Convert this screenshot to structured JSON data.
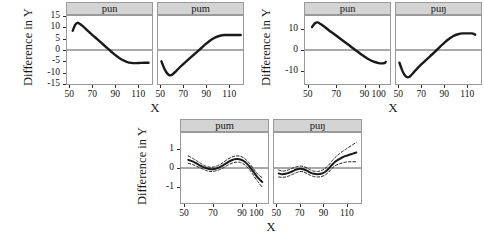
{
  "figure": {
    "groups": [
      {
        "name": "top-left",
        "ylabel": "Difference in Y",
        "xlabel": "X",
        "ylim": [
          -15,
          15
        ],
        "yticks": [
          "15",
          "10",
          "5",
          "0",
          "-5",
          "-10",
          "-15"
        ],
        "ytick_values": [
          15,
          10,
          5,
          0,
          -5,
          -10,
          -15
        ],
        "panels": [
          {
            "label": "pun",
            "xlim": [
              48,
              122
            ],
            "xticks": [
              "50",
              "70",
              "90",
              "110"
            ],
            "xtick_values": [
              50,
              70,
              90,
              110
            ],
            "series": [
              {
                "name": "fitted",
                "style": "solid",
                "x": [
                  53,
                  55,
                  57,
                  59,
                  62,
                  65,
                  68,
                  72,
                  76,
                  80,
                  84,
                  88,
                  92,
                  96,
                  100,
                  104,
                  108,
                  112,
                  116,
                  119
                ],
                "y": [
                  8.5,
                  11.0,
                  12.0,
                  11.6,
                  10.4,
                  9.0,
                  7.6,
                  5.8,
                  4.0,
                  2.2,
                  0.4,
                  -1.4,
                  -3.0,
                  -4.3,
                  -5.2,
                  -5.7,
                  -5.8,
                  -5.7,
                  -5.6,
                  -5.6
                ]
              }
            ]
          },
          {
            "label": "pum",
            "xlim": [
              48,
              122
            ],
            "xticks": [
              "50",
              "70",
              "90",
              "110"
            ],
            "xtick_values": [
              50,
              70,
              90,
              110
            ],
            "series": [
              {
                "name": "fitted",
                "style": "solid",
                "x": [
                  51,
                  53,
                  55,
                  57,
                  59,
                  61,
                  64,
                  67,
                  70,
                  74,
                  78,
                  82,
                  86,
                  90,
                  94,
                  98,
                  102,
                  106,
                  110,
                  114,
                  118,
                  120
                ],
                "y": [
                  -5.0,
                  -7.6,
                  -9.6,
                  -10.8,
                  -11.2,
                  -10.6,
                  -9.2,
                  -7.6,
                  -6.2,
                  -4.4,
                  -2.6,
                  -0.8,
                  1.0,
                  2.8,
                  4.4,
                  5.6,
                  6.3,
                  6.6,
                  6.6,
                  6.6,
                  6.6,
                  6.6
                ]
              }
            ]
          }
        ]
      },
      {
        "name": "top-right",
        "ylabel": "Difference in Y",
        "xlabel": "X",
        "ylim": [
          -16,
          16
        ],
        "yticks": [
          "10",
          "0",
          "-10"
        ],
        "ytick_values": [
          10,
          0,
          -10
        ],
        "panels": [
          {
            "label": "pun",
            "xlim": [
              48,
              108
            ],
            "xticks": [
              "50",
              "70",
              "90",
              "100"
            ],
            "xtick_values": [
              50,
              70,
              90,
              100
            ],
            "series": [
              {
                "name": "fitted",
                "style": "solid",
                "x": [
                  53,
                  55,
                  57,
                  59,
                  62,
                  65,
                  68,
                  72,
                  76,
                  80,
                  84,
                  88,
                  92,
                  96,
                  100,
                  102,
                  104,
                  105
                ],
                "y": [
                  10.8,
                  12.6,
                  13.0,
                  12.2,
                  10.8,
                  9.2,
                  7.8,
                  5.8,
                  3.8,
                  1.8,
                  -0.2,
                  -2.2,
                  -4.0,
                  -5.4,
                  -6.2,
                  -6.3,
                  -6.2,
                  -5.6
                ]
              }
            ]
          },
          {
            "label": "puŋ",
            "xlim": [
              48,
              122
            ],
            "xticks": [
              "50",
              "70",
              "90",
              "110"
            ],
            "xtick_values": [
              50,
              70,
              90,
              110
            ],
            "series": [
              {
                "name": "fitted",
                "style": "solid",
                "x": [
                  51,
                  53,
                  55,
                  57,
                  59,
                  61,
                  64,
                  67,
                  70,
                  74,
                  78,
                  82,
                  86,
                  90,
                  94,
                  98,
                  102,
                  106,
                  110,
                  114,
                  117
                ],
                "y": [
                  -6.0,
                  -9.0,
                  -11.4,
                  -12.6,
                  -12.8,
                  -12.0,
                  -10.2,
                  -8.4,
                  -6.8,
                  -4.8,
                  -2.8,
                  -0.8,
                  1.4,
                  3.4,
                  5.2,
                  6.6,
                  7.4,
                  7.8,
                  7.8,
                  7.8,
                  7.2
                ]
              }
            ]
          }
        ]
      },
      {
        "name": "bottom",
        "ylabel": "Difference in Y",
        "xlabel": "X",
        "ylim": [
          -1.8,
          1.8
        ],
        "yticks": [
          "1",
          "0",
          "-1"
        ],
        "ytick_values": [
          1,
          0,
          -1
        ],
        "panels": [
          {
            "label": "pum",
            "xlim": [
              48,
              108
            ],
            "xticks": [
              "50",
              "70",
              "90",
              "100"
            ],
            "xtick_values": [
              50,
              70,
              90,
              100
            ],
            "series": [
              {
                "name": "fitted",
                "style": "solid",
                "x": [
                  53,
                  56,
                  59,
                  62,
                  65,
                  68,
                  71,
                  74,
                  77,
                  80,
                  83,
                  86,
                  89,
                  92,
                  95,
                  98,
                  101,
                  104
                ],
                "y": [
                  0.42,
                  0.34,
                  0.22,
                  0.1,
                  0.0,
                  -0.06,
                  -0.05,
                  0.02,
                  0.14,
                  0.28,
                  0.4,
                  0.46,
                  0.44,
                  0.32,
                  0.1,
                  -0.2,
                  -0.5,
                  -0.72
                ]
              },
              {
                "name": "upper-ci",
                "style": "dashed",
                "x": [
                  53,
                  56,
                  59,
                  62,
                  65,
                  68,
                  71,
                  74,
                  77,
                  80,
                  83,
                  86,
                  89,
                  92,
                  95,
                  98,
                  101,
                  104
                ],
                "y": [
                  0.62,
                  0.5,
                  0.36,
                  0.22,
                  0.1,
                  0.04,
                  0.06,
                  0.14,
                  0.28,
                  0.44,
                  0.56,
                  0.62,
                  0.6,
                  0.48,
                  0.26,
                  -0.04,
                  -0.32,
                  -0.5
                ]
              },
              {
                "name": "lower-ci",
                "style": "dashed",
                "x": [
                  53,
                  56,
                  59,
                  62,
                  65,
                  68,
                  71,
                  74,
                  77,
                  80,
                  83,
                  86,
                  89,
                  92,
                  95,
                  98,
                  101,
                  104
                ],
                "y": [
                  0.24,
                  0.18,
                  0.08,
                  -0.02,
                  -0.12,
                  -0.18,
                  -0.16,
                  -0.1,
                  0.0,
                  0.14,
                  0.24,
                  0.3,
                  0.28,
                  0.16,
                  -0.06,
                  -0.38,
                  -0.7,
                  -0.98
                ]
              }
            ]
          },
          {
            "label": "puŋ",
            "xlim": [
              48,
              122
            ],
            "xticks": [
              "50",
              "70",
              "90",
              "110"
            ],
            "xtick_values": [
              50,
              70,
              90,
              110
            ],
            "series": [
              {
                "name": "fitted",
                "style": "solid",
                "x": [
                  52,
                  55,
                  58,
                  61,
                  64,
                  67,
                  70,
                  73,
                  76,
                  79,
                  82,
                  85,
                  88,
                  91,
                  94,
                  97,
                  100,
                  103,
                  106,
                  109,
                  112,
                  115,
                  118
                ],
                "y": [
                  -0.28,
                  -0.32,
                  -0.3,
                  -0.24,
                  -0.16,
                  -0.08,
                  -0.04,
                  -0.06,
                  -0.14,
                  -0.24,
                  -0.3,
                  -0.32,
                  -0.3,
                  -0.22,
                  -0.06,
                  0.14,
                  0.32,
                  0.44,
                  0.54,
                  0.62,
                  0.68,
                  0.74,
                  0.8
                ]
              },
              {
                "name": "upper-ci",
                "style": "dashed",
                "x": [
                  52,
                  55,
                  58,
                  61,
                  64,
                  67,
                  70,
                  73,
                  76,
                  79,
                  82,
                  85,
                  88,
                  91,
                  94,
                  97,
                  100,
                  103,
                  106,
                  109,
                  112,
                  115,
                  118
                ],
                "y": [
                  -0.1,
                  -0.16,
                  -0.14,
                  -0.08,
                  0.0,
                  0.06,
                  0.1,
                  0.08,
                  0.0,
                  -0.1,
                  -0.16,
                  -0.18,
                  -0.14,
                  -0.04,
                  0.12,
                  0.34,
                  0.54,
                  0.7,
                  0.84,
                  0.96,
                  1.08,
                  1.2,
                  1.32
                ]
              },
              {
                "name": "lower-ci",
                "style": "dashed",
                "x": [
                  52,
                  55,
                  58,
                  61,
                  64,
                  67,
                  70,
                  73,
                  76,
                  79,
                  82,
                  85,
                  88,
                  91,
                  94,
                  97,
                  100,
                  103,
                  106,
                  109,
                  112,
                  115,
                  118
                ],
                "y": [
                  -0.46,
                  -0.48,
                  -0.46,
                  -0.4,
                  -0.32,
                  -0.24,
                  -0.18,
                  -0.2,
                  -0.28,
                  -0.38,
                  -0.44,
                  -0.46,
                  -0.44,
                  -0.38,
                  -0.24,
                  -0.04,
                  0.12,
                  0.2,
                  0.26,
                  0.3,
                  0.32,
                  0.32,
                  0.32
                ]
              }
            ]
          }
        ]
      }
    ],
    "colors": {
      "curve": "#1a1a1a",
      "zero_line": "#555555",
      "strip_fill": "#d4d4d4",
      "strip_border": "#9a9a9a",
      "axis": "#2b2b2b",
      "text": "#111111"
    }
  }
}
